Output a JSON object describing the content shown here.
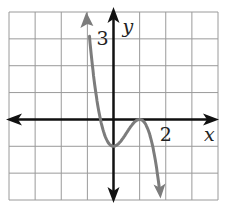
{
  "chart_data": {
    "type": "line",
    "title": "",
    "xlabel": "x",
    "ylabel": "y",
    "xlim": [
      -4,
      4
    ],
    "ylim": [
      -3,
      4
    ],
    "grid": true,
    "grid_step": 1,
    "tick_labels": [
      {
        "axis": "x",
        "value": 2,
        "text": "2"
      },
      {
        "axis": "y",
        "value": 3,
        "text": "3"
      }
    ],
    "series": [
      {
        "name": "f(x)",
        "color": "#7c7c7c",
        "x": [
          -1.0,
          -0.9,
          -0.75,
          -0.5,
          -0.25,
          0,
          0.25,
          0.5,
          0.75,
          1.0,
          1.25,
          1.5,
          1.65,
          1.8
        ],
        "y": [
          4.0,
          3.89,
          1.53,
          0.0,
          -0.78,
          -1.0,
          -0.84,
          -0.5,
          -0.16,
          0.0,
          -0.22,
          -1.0,
          -1.82,
          -2.94
        ],
        "features": {
          "local_min": [
            0,
            -1
          ],
          "local_max": [
            1,
            0
          ],
          "x_intercepts": [
            -0.5,
            1
          ]
        },
        "arrows_at_ends": true
      }
    ],
    "axis_color": "#111111",
    "grid_color": "#9a9a9a"
  }
}
